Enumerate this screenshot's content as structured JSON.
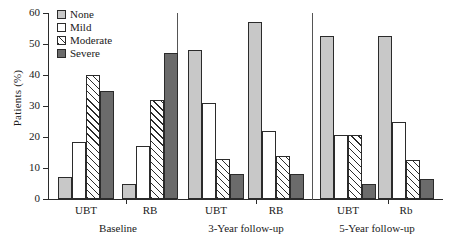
{
  "chart_data": {
    "type": "bar",
    "title": "",
    "xlabel": "",
    "ylabel": "Patients (%)",
    "ylim": [
      0,
      60
    ],
    "yticks": [
      0,
      10,
      20,
      30,
      40,
      50,
      60
    ],
    "grid": false,
    "legend_position": "top-left",
    "categories": [
      "UBT",
      "RB",
      "UBT",
      "RB",
      "UBT",
      "Rb"
    ],
    "groups": [
      {
        "label": "Baseline",
        "categories": [
          "UBT",
          "RB"
        ]
      },
      {
        "label": "3-Year follow-up",
        "categories": [
          "UBT",
          "RB"
        ]
      },
      {
        "label": "5-Year follow-up",
        "categories": [
          "UBT",
          "Rb"
        ]
      }
    ],
    "series": [
      {
        "name": "None",
        "color": "#c8c8c8",
        "fill": "solid-light",
        "values": [
          7,
          5,
          48,
          57,
          52.5,
          52.5
        ]
      },
      {
        "name": "Mild",
        "color": "#ffffff",
        "fill": "empty",
        "values": [
          18.5,
          17,
          31,
          22,
          20.5,
          25
        ]
      },
      {
        "name": "Moderate",
        "color": "#ffffff",
        "fill": "hatched",
        "values": [
          40,
          32,
          13,
          14,
          20.5,
          12.5
        ]
      },
      {
        "name": "Severe",
        "color": "#6b6b6b",
        "fill": "solid-dark",
        "values": [
          35,
          47,
          8,
          8,
          5,
          6.5
        ]
      }
    ]
  },
  "legend": {
    "items": [
      {
        "label": "None"
      },
      {
        "label": "Mild"
      },
      {
        "label": "Moderate"
      },
      {
        "label": "Severe"
      }
    ]
  },
  "axis": {
    "y_label": "Patients (%)",
    "y_ticks": [
      "60",
      "50",
      "40",
      "30",
      "20",
      "10",
      "0"
    ]
  }
}
